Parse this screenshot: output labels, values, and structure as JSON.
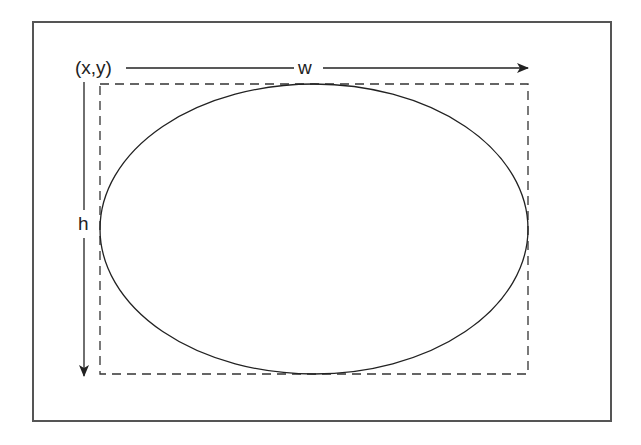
{
  "diagram": {
    "labels": {
      "origin": "(x,y)",
      "width": "w",
      "height": "h"
    },
    "colors": {
      "stroke": "#222222",
      "frame": "#555555",
      "background": "#ffffff"
    },
    "shapes": {
      "frame": {
        "x": 33,
        "y": 22,
        "w": 578,
        "h": 399
      },
      "bounding_box": {
        "x": 100,
        "y": 84,
        "w": 428,
        "h": 290,
        "style": "dashed"
      },
      "ellipse": {
        "cx": 314,
        "cy": 229,
        "rx": 214,
        "ry": 145
      },
      "width_arrow": {
        "x1": 125,
        "y1": 68,
        "x2": 528,
        "y2": 68
      },
      "height_arrow": {
        "x1": 84,
        "y1": 82,
        "x2": 84,
        "y2": 375
      }
    }
  }
}
